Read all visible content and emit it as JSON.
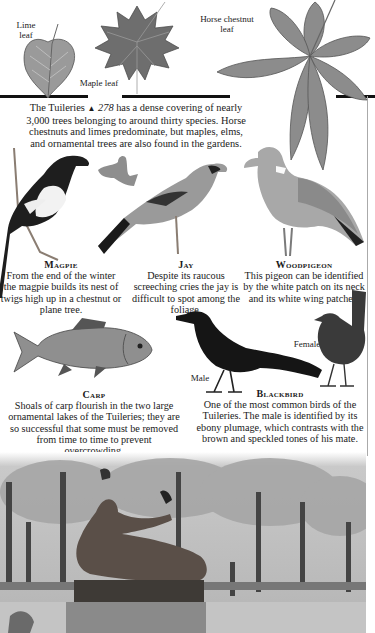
{
  "leaves": {
    "lime_label": "Lime\nleaf",
    "lime_label_l1": "Lime",
    "lime_label_l2": "leaf",
    "maple_label": "Maple leaf",
    "horse_label_l1": "Horse chestnut",
    "horse_label_l2": "leaf"
  },
  "intro": {
    "text_before": "The Tuileries ",
    "marker": "▲",
    "page_ref": " 278",
    "text_after": " has a dense covering of nearly 3,000 trees belonging to around thirty species. Horse chestnuts and limes predominate, but maples, elms, and ornamental trees are also found in the gardens."
  },
  "birds": {
    "magpie": {
      "title": "Magpie",
      "text": "From the end of the winter the magpie builds its nest of twigs high up in a chestnut or plane tree."
    },
    "jay": {
      "title": "Jay",
      "text": "Despite its raucous screeching cries the jay is difficult to spot among the foliage."
    },
    "woodpigeon": {
      "title": "Woodpigeon",
      "text": "This pigeon can be identified by the white patch on its neck and its white wing patches."
    },
    "carp": {
      "title": "Carp",
      "text": "Shoals of carp flourish in the two large ornamental lakes of the Tuileries; they are so successful that some must be removed from time to time to prevent overcrowding."
    },
    "blackbird": {
      "title": "Blackbird",
      "text": "One of the most common birds of the Tuileries. The male is identified by its ebony plumage, which contrasts with the brown and speckled tones of his mate.",
      "male_label": "Male",
      "female_label": "Female"
    }
  },
  "photo": {
    "subject": "Bronze reclining sculpture in the Tuileries gardens with birds, trees and benches"
  }
}
